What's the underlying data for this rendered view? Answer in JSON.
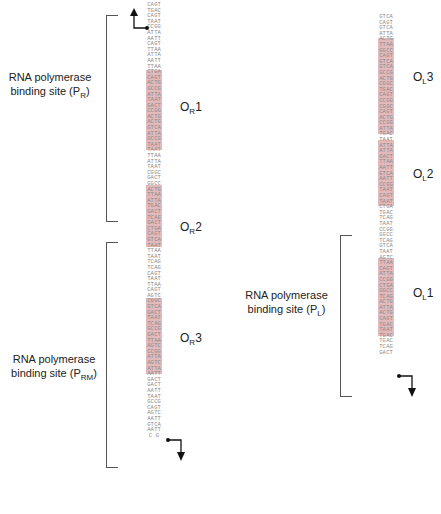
{
  "left_region": {
    "promoter_PR": {
      "label_line1": "RNA polymerase",
      "label_line2": "binding site (P",
      "subscript": "R",
      "close": ")"
    },
    "promoter_PRM": {
      "label_line1": "RNA polymerase",
      "label_line2": "binding site (P",
      "subscript": "RM",
      "close": ")"
    },
    "operators": [
      {
        "name": "O",
        "subscript": "R",
        "number": "1"
      },
      {
        "name": "O",
        "subscript": "R",
        "number": "2"
      },
      {
        "name": "O",
        "subscript": "R",
        "number": "3"
      }
    ],
    "strand_top": "CATGCATACCATAACATTATAATTCTCAACGCATTAGACCACACGTATGCTATATTATTACGGAGGACTTATTGGATCGACTCAGTTATTTATCTCCATATTCAAGCGGTGATATCGCGATTAGCCATAGATAAGAGAAATAGCCAAGAAGTAAC",
    "strand_bottom": "GTACGTATGGTATTGTAATATTAAGAGTTGCGTAATCTGGTGTGCATACGATATAATAATGCCTCCTGAATAACCTAGCTGAGTCAATAAATAGAGGTATAAGTTCGCCACTATAGCGCTAATCGGTATCTATTCTCTTTATCGGTTCTTCATTG"
  },
  "right_region": {
    "promoter_PL": {
      "label_line1": "RNA polymerase",
      "label_line2": "binding site (P",
      "subscript": "L",
      "close": ")"
    },
    "operators": [
      {
        "name": "O",
        "subscript": "L",
        "number": "3"
      },
      {
        "name": "O",
        "subscript": "L",
        "number": "2"
      },
      {
        "name": "O",
        "subscript": "L",
        "number": "1"
      }
    ],
    "strand_top": "GTCAGTATACTTGGCAGTGTGCACCGTGCACCCGCAACCCATTGTAATATGATTAAGTAACCTACATACTTGTCTACCGGTCGTTAAGTTCAATCCCTGGTCACATACCATGTATGTGTCGA",
    "strand_bottom": "CAGTCATATGAACCGTCACACGTGGCACGTGGGCGTTGGGTAACATTATACTAATTCATTGGATGTATGAACAGATGGCCAGCAATTCAAGTTAGGGACCAGTGTATGGTACATACACAGCT"
  },
  "colors": {
    "operator_shade": "#d9a3a5",
    "sequence_text": "#888888",
    "bracket": "#555555",
    "label": "#222222"
  }
}
